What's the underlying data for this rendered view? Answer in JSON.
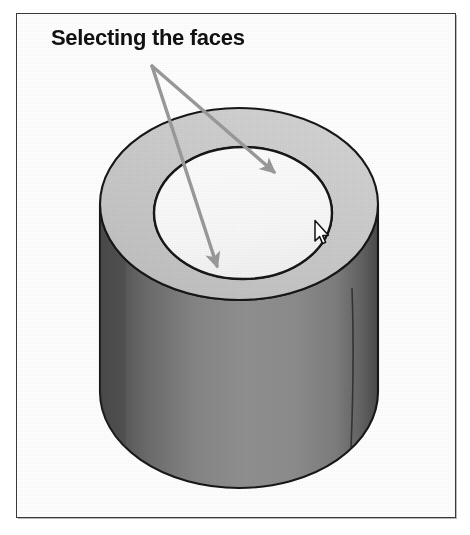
{
  "figure": {
    "caption": "Selecting the faces",
    "frame": {
      "x": 16,
      "y": 13,
      "width": 440,
      "height": 505,
      "border_color": "#3a3a3c",
      "background_color": "#ffffff"
    }
  },
  "illustration": {
    "object_name": "cylinder-3d-solid",
    "description": "Shaded 3D cylinder viewed from above, hollow tube with an annular top face",
    "colors": {
      "top_annulus_fill": "#c9c9c9",
      "inner_bore_fill": "#fafafa",
      "body_light": "#8e8e8e",
      "body_mid": "#7d7d7d",
      "body_dark": "#5a5a5a",
      "outline": "#17171a",
      "annotation_arrow": "#9a9a9a",
      "cursor_fill": "#ffffff",
      "cursor_outline": "#111111"
    },
    "geometry": {
      "top_ellipse_center": [
        239,
        204
      ],
      "top_ellipse_rx": 139,
      "top_ellipse_ry": 96,
      "bore_ellipse_center": [
        243,
        213
      ],
      "bore_ellipse_rx": 89,
      "bore_ellipse_ry": 66,
      "bottom_ellipse_center": [
        239,
        392
      ],
      "bottom_ellipse_rx": 139,
      "bottom_ellipse_ry": 96,
      "body_left_edge_x": 100,
      "body_right_edge_x": 378,
      "body_seam_x": 352
    }
  },
  "annotations": {
    "arrows": [
      {
        "name": "arrow-to-top-annulus-face",
        "from": [
          152,
          66
        ],
        "to": [
          274,
          172
        ],
        "color": "#9a9a9a",
        "target": "top annular face"
      },
      {
        "name": "arrow-to-inner-bore-face",
        "from": [
          152,
          66
        ],
        "to": [
          217,
          266
        ],
        "color": "#9a9a9a",
        "target": "inner bore face"
      }
    ]
  },
  "pointer": {
    "name": "mouse-cursor",
    "kind": "arrow-pointer",
    "x": 313,
    "y": 219
  }
}
